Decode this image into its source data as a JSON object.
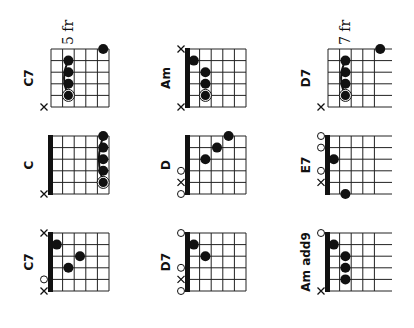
{
  "layout": {
    "columns_x": [
      51,
      188,
      328
    ],
    "rows_y": [
      49,
      136,
      233
    ],
    "grid_width": 58,
    "grid_height": 58,
    "frets": 5,
    "strings": 6,
    "ink_color": "#111111",
    "line_color": "#222222"
  },
  "chords": [
    {
      "name": "C7",
      "col": 0,
      "row": 0,
      "nut": false,
      "fret_label": "5 fr",
      "open_right": false,
      "markers": [
        {
          "string": 6,
          "type": "x"
        }
      ],
      "dots": [
        {
          "string": 1,
          "fret": 5
        },
        {
          "string": 2,
          "fret": 2
        },
        {
          "string": 3,
          "fret": 2
        },
        {
          "string": 4,
          "fret": 2
        },
        {
          "string": 5,
          "fret": 2,
          "root": true
        }
      ],
      "barre": {
        "fret": 2,
        "from": 2,
        "to": 5
      }
    },
    {
      "name": "Am",
      "col": 1,
      "row": 0,
      "nut": true,
      "fret_label": "",
      "open_right": false,
      "markers": [
        {
          "string": 1,
          "type": "x"
        },
        {
          "string": 6,
          "type": "x"
        }
      ],
      "dots": [
        {
          "string": 2,
          "fret": 1
        },
        {
          "string": 3,
          "fret": 2
        },
        {
          "string": 4,
          "fret": 2
        },
        {
          "string": 5,
          "fret": 2,
          "root": true
        }
      ],
      "barre": null
    },
    {
      "name": "D7",
      "col": 2,
      "row": 0,
      "nut": false,
      "fret_label": "7 fr",
      "open_right": true,
      "markers": [
        {
          "string": 6,
          "type": "x"
        }
      ],
      "dots": [
        {
          "string": 1,
          "fret": 5
        },
        {
          "string": 2,
          "fret": 2
        },
        {
          "string": 3,
          "fret": 2
        },
        {
          "string": 4,
          "fret": 2
        },
        {
          "string": 5,
          "fret": 2,
          "root": true
        }
      ],
      "barre": {
        "fret": 2,
        "from": 2,
        "to": 5
      }
    },
    {
      "name": "C",
      "col": 0,
      "row": 1,
      "nut": true,
      "fret_label": "",
      "open_right": false,
      "markers": [
        {
          "string": 6,
          "type": "x"
        }
      ],
      "dots": [
        {
          "string": 1,
          "fret": 5
        },
        {
          "string": 2,
          "fret": 5
        },
        {
          "string": 3,
          "fret": 5
        },
        {
          "string": 4,
          "fret": 5
        },
        {
          "string": 5,
          "fret": 5,
          "root": true
        }
      ],
      "barre": {
        "fret": 5,
        "from": 1,
        "to": 5
      }
    },
    {
      "name": "D",
      "col": 1,
      "row": 1,
      "nut": true,
      "fret_label": "",
      "open_right": false,
      "markers": [
        {
          "string": 4,
          "type": "o"
        },
        {
          "string": 5,
          "type": "x"
        },
        {
          "string": 6,
          "type": "o"
        }
      ],
      "dots": [
        {
          "string": 1,
          "fret": 4
        },
        {
          "string": 2,
          "fret": 3
        },
        {
          "string": 3,
          "fret": 2
        }
      ],
      "barre": null
    },
    {
      "name": "E7",
      "col": 2,
      "row": 1,
      "nut": true,
      "fret_label": "",
      "open_right": true,
      "markers": [
        {
          "string": 1,
          "type": "o"
        },
        {
          "string": 2,
          "type": "o"
        },
        {
          "string": 4,
          "type": "o"
        },
        {
          "string": 5,
          "type": "x"
        }
      ],
      "dots": [
        {
          "string": 3,
          "fret": 1
        },
        {
          "string": 6,
          "fret": 2
        }
      ],
      "barre": null
    },
    {
      "name": "C7",
      "col": 0,
      "row": 2,
      "nut": true,
      "fret_label": "",
      "open_right": false,
      "markers": [
        {
          "string": 1,
          "type": "x"
        },
        {
          "string": 5,
          "type": "o"
        },
        {
          "string": 6,
          "type": "x"
        }
      ],
      "dots": [
        {
          "string": 2,
          "fret": 1
        },
        {
          "string": 3,
          "fret": 3
        },
        {
          "string": 4,
          "fret": 2
        }
      ],
      "barre": null
    },
    {
      "name": "D7",
      "col": 1,
      "row": 2,
      "nut": true,
      "fret_label": "",
      "open_right": false,
      "markers": [
        {
          "string": 1,
          "type": "o"
        },
        {
          "string": 4,
          "type": "o"
        },
        {
          "string": 5,
          "type": "x"
        },
        {
          "string": 6,
          "type": "o"
        }
      ],
      "dots": [
        {
          "string": 2,
          "fret": 1
        },
        {
          "string": 3,
          "fret": 2
        }
      ],
      "barre": null
    },
    {
      "name": "Am add9",
      "col": 2,
      "row": 2,
      "nut": true,
      "fret_label": "",
      "open_right": true,
      "markers": [
        {
          "string": 1,
          "type": "o"
        },
        {
          "string": 6,
          "type": "x"
        }
      ],
      "dots": [
        {
          "string": 2,
          "fret": 1
        },
        {
          "string": 3,
          "fret": 2
        },
        {
          "string": 4,
          "fret": 2
        },
        {
          "string": 5,
          "fret": 2
        }
      ],
      "barre": null
    }
  ]
}
